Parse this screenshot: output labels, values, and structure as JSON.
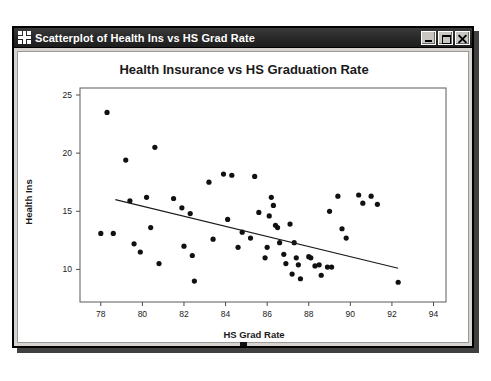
{
  "window": {
    "title": "Scatterplot of Health Ins vs HS Grad Rate",
    "icon": "minitab-graph-icon",
    "buttons": {
      "minimize": "Minimize",
      "maximize": "Maximize",
      "close": "Close"
    }
  },
  "chart_data": {
    "type": "scatter",
    "title": "Health Insurance vs HS Graduation Rate",
    "xlabel": "HS Grad Rate",
    "ylabel": "Health Ins",
    "xlim": [
      77.0,
      94.6
    ],
    "ylim": [
      7.2,
      25.6
    ],
    "xticks": [
      78,
      80,
      82,
      84,
      86,
      88,
      90,
      92,
      94
    ],
    "yticks": [
      10,
      15,
      20,
      25
    ],
    "grid": false,
    "legend": null,
    "points": [
      [
        78.3,
        23.5
      ],
      [
        78.0,
        13.1
      ],
      [
        78.6,
        13.1
      ],
      [
        79.2,
        19.4
      ],
      [
        79.4,
        15.9
      ],
      [
        79.6,
        12.2
      ],
      [
        79.9,
        11.5
      ],
      [
        80.2,
        16.2
      ],
      [
        80.6,
        20.5
      ],
      [
        80.4,
        13.6
      ],
      [
        80.8,
        10.5
      ],
      [
        81.5,
        16.1
      ],
      [
        81.9,
        15.3
      ],
      [
        82.0,
        12.0
      ],
      [
        82.3,
        14.8
      ],
      [
        82.4,
        11.2
      ],
      [
        82.5,
        9.0
      ],
      [
        83.2,
        17.5
      ],
      [
        83.4,
        12.6
      ],
      [
        83.9,
        18.2
      ],
      [
        84.3,
        18.1
      ],
      [
        84.1,
        14.3
      ],
      [
        84.6,
        11.9
      ],
      [
        84.8,
        13.2
      ],
      [
        85.4,
        18.0
      ],
      [
        85.6,
        14.9
      ],
      [
        85.2,
        12.7
      ],
      [
        85.9,
        11.0
      ],
      [
        86.2,
        16.2
      ],
      [
        86.3,
        15.5
      ],
      [
        86.1,
        14.6
      ],
      [
        86.4,
        13.8
      ],
      [
        86.5,
        13.6
      ],
      [
        86.6,
        12.3
      ],
      [
        86.0,
        11.9
      ],
      [
        86.8,
        11.3
      ],
      [
        86.9,
        10.5
      ],
      [
        87.1,
        13.9
      ],
      [
        87.3,
        12.3
      ],
      [
        87.4,
        11.0
      ],
      [
        87.5,
        10.4
      ],
      [
        87.2,
        9.6
      ],
      [
        87.6,
        9.2
      ],
      [
        88.0,
        11.1
      ],
      [
        88.1,
        11.0
      ],
      [
        88.3,
        10.3
      ],
      [
        88.5,
        10.4
      ],
      [
        88.6,
        9.5
      ],
      [
        88.9,
        10.2
      ],
      [
        89.1,
        10.2
      ],
      [
        89.4,
        16.3
      ],
      [
        89.0,
        15.0
      ],
      [
        89.6,
        13.5
      ],
      [
        89.8,
        12.7
      ],
      [
        90.4,
        16.4
      ],
      [
        91.0,
        16.3
      ],
      [
        90.6,
        15.7
      ],
      [
        91.3,
        15.6
      ],
      [
        92.3,
        8.9
      ]
    ],
    "fit_line": {
      "label": "regression-line",
      "x1": 78.7,
      "y1": 16.0,
      "x2": 92.3,
      "y2": 10.1
    }
  }
}
